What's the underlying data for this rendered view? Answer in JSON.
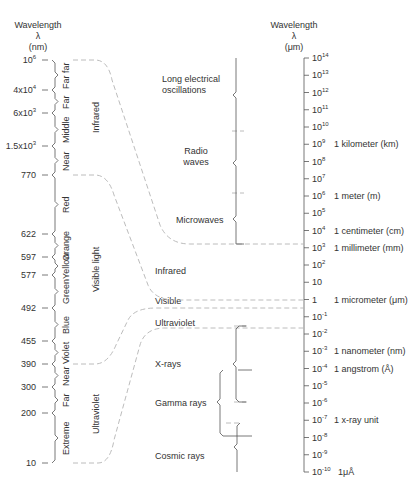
{
  "left_axis": {
    "title": "Wavelength",
    "symbol": "λ",
    "unit": "(nm)",
    "ticks": [
      {
        "label": "10",
        "sup": "6",
        "y": 60
      },
      {
        "label": "4x10",
        "sup": "4",
        "y": 90
      },
      {
        "label": "6x10",
        "sup": "3",
        "y": 113
      },
      {
        "label": "1.5x10",
        "sup": "3",
        "y": 146
      },
      {
        "label": "770",
        "sup": "",
        "y": 175
      },
      {
        "label": "622",
        "sup": "",
        "y": 234
      },
      {
        "label": "597",
        "sup": "",
        "y": 257
      },
      {
        "label": "577",
        "sup": "",
        "y": 275
      },
      {
        "label": "492",
        "sup": "",
        "y": 308
      },
      {
        "label": "455",
        "sup": "",
        "y": 341
      },
      {
        "label": "390",
        "sup": "",
        "y": 364
      },
      {
        "label": "300",
        "sup": "",
        "y": 387
      },
      {
        "label": "200",
        "sup": "",
        "y": 413
      },
      {
        "label": "10",
        "sup": "",
        "y": 463
      }
    ],
    "sub_bands": [
      {
        "label": "Far far",
        "y_top": 60,
        "y_bot": 90
      },
      {
        "label": "Far",
        "y_top": 90,
        "y_bot": 113
      },
      {
        "label": "Middle",
        "y_top": 113,
        "y_bot": 146
      },
      {
        "label": "Near",
        "y_top": 146,
        "y_bot": 175
      },
      {
        "label": "Red",
        "y_top": 175,
        "y_bot": 234
      },
      {
        "label": "Orange",
        "y_top": 234,
        "y_bot": 257
      },
      {
        "label": "Yellow",
        "y_top": 257,
        "y_bot": 275
      },
      {
        "label": "Green",
        "y_top": 275,
        "y_bot": 308
      },
      {
        "label": "Blue",
        "y_top": 308,
        "y_bot": 341
      },
      {
        "label": "Violet",
        "y_top": 341,
        "y_bot": 364
      },
      {
        "label": "Near",
        "y_top": 364,
        "y_bot": 387
      },
      {
        "label": "Far",
        "y_top": 387,
        "y_bot": 413
      },
      {
        "label": "Extreme",
        "y_top": 413,
        "y_bot": 463
      }
    ],
    "groups": [
      {
        "label": "Infrared",
        "y_top": 60,
        "y_bot": 175
      },
      {
        "label": "Visible light",
        "y_top": 175,
        "y_bot": 364
      },
      {
        "label": "Ultraviolet",
        "y_top": 364,
        "y_bot": 463
      }
    ]
  },
  "right_axis": {
    "title": "Wavelength",
    "symbol": "λ",
    "unit": "(μm)",
    "ticks": [
      {
        "base": "10",
        "exp": "14",
        "unit": ""
      },
      {
        "base": "10",
        "exp": "13",
        "unit": ""
      },
      {
        "base": "10",
        "exp": "12",
        "unit": ""
      },
      {
        "base": "10",
        "exp": "11",
        "unit": ""
      },
      {
        "base": "10",
        "exp": "10",
        "unit": ""
      },
      {
        "base": "10",
        "exp": "9",
        "unit": "1 kilometer (km)"
      },
      {
        "base": "10",
        "exp": "8",
        "unit": ""
      },
      {
        "base": "10",
        "exp": "7",
        "unit": ""
      },
      {
        "base": "10",
        "exp": "6",
        "unit": "1 meter (m)"
      },
      {
        "base": "10",
        "exp": "5",
        "unit": ""
      },
      {
        "base": "10",
        "exp": "4",
        "unit": "1 centimeter (cm)"
      },
      {
        "base": "10",
        "exp": "3",
        "unit": "1 millimeter (mm)"
      },
      {
        "base": "10",
        "exp": "2",
        "unit": ""
      },
      {
        "base": "10",
        "exp": "",
        "unit": ""
      },
      {
        "base": "1",
        "exp": "",
        "unit": "1 micrometer (μm)"
      },
      {
        "base": "10",
        "exp": "-1",
        "unit": ""
      },
      {
        "base": "10",
        "exp": "-2",
        "unit": ""
      },
      {
        "base": "10",
        "exp": "-3",
        "unit": "1 nanometer (nm)"
      },
      {
        "base": "10",
        "exp": "-4",
        "unit": "1 angstrom (Å)"
      },
      {
        "base": "10",
        "exp": "-5",
        "unit": ""
      },
      {
        "base": "10",
        "exp": "-6",
        "unit": ""
      },
      {
        "base": "10",
        "exp": "-7",
        "unit": "1 x-ray unit"
      },
      {
        "base": "10",
        "exp": "-8",
        "unit": ""
      },
      {
        "base": "10",
        "exp": "-9",
        "unit": ""
      },
      {
        "base": "10",
        "exp": "-10",
        "unit": "1μÅ"
      }
    ]
  },
  "bands": [
    {
      "label_lines": [
        "Long electrical",
        "oscillations"
      ]
    },
    {
      "label_lines": [
        "Radio",
        "waves"
      ]
    },
    {
      "label_lines": [
        "Microwaves"
      ]
    },
    {
      "label_lines": [
        "Infrared"
      ]
    },
    {
      "label_lines": [
        "Visible"
      ]
    },
    {
      "label_lines": [
        "Ultraviolet"
      ]
    },
    {
      "label_lines": [
        "X-rays"
      ]
    },
    {
      "label_lines": [
        "Gamma rays"
      ]
    },
    {
      "label_lines": [
        "Cosmic rays"
      ]
    }
  ],
  "colors": {
    "line": "#555555",
    "dash": "#b0b0b0",
    "text": "#333333"
  }
}
